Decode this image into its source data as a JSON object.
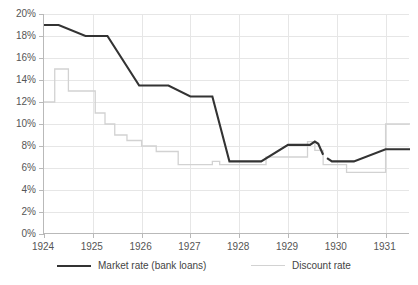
{
  "chart_data": {
    "type": "line",
    "title": "",
    "subtitle": "",
    "xlabel": "",
    "ylabel": "",
    "xlim": [
      1924.0,
      1931.5
    ],
    "ylim": [
      0,
      20
    ],
    "grid": true,
    "legend_position": "bottom",
    "y_ticks": [
      "0%",
      "2%",
      "4%",
      "6%",
      "8%",
      "10%",
      "12%",
      "14%",
      "16%",
      "18%",
      "20%"
    ],
    "y_tick_values": [
      0,
      2,
      4,
      6,
      8,
      10,
      12,
      14,
      16,
      18,
      20
    ],
    "x_ticks": [
      "1924",
      "1925",
      "1926",
      "1927",
      "1928",
      "1929",
      "1930",
      "1931"
    ],
    "x_tick_values": [
      1924,
      1925,
      1926,
      1927,
      1928,
      1929,
      1930,
      1931
    ],
    "colors": {
      "market_rate": "#333333",
      "discount_rate": "#d2d2d2",
      "grid": "#e6e6e6",
      "axis": "#b9b9b9",
      "text": "#555555",
      "background": "#ffffff"
    },
    "series": [
      {
        "name": "Market rate (bank loans)",
        "style": "solid-thick",
        "color": "#333333",
        "points": [
          [
            1924.0,
            19.0
          ],
          [
            1924.3,
            19.0
          ],
          [
            1924.85,
            18.0
          ],
          [
            1925.3,
            18.0
          ],
          [
            1925.95,
            13.5
          ],
          [
            1926.55,
            13.5
          ],
          [
            1927.0,
            12.5
          ],
          [
            1927.45,
            12.5
          ],
          [
            1927.8,
            6.6
          ],
          [
            1928.45,
            6.6
          ],
          [
            1929.0,
            8.1
          ],
          [
            1929.45,
            8.1
          ],
          [
            1929.55,
            8.4
          ],
          [
            1929.62,
            8.2
          ],
          [
            1929.72,
            7.2
          ]
        ],
        "points_segment2": [
          [
            1929.8,
            6.9
          ],
          [
            1929.9,
            6.6
          ],
          [
            1930.35,
            6.6
          ],
          [
            1931.0,
            7.7
          ],
          [
            1931.5,
            7.7
          ]
        ]
      },
      {
        "name": "Discount rate",
        "style": "step",
        "color": "#d2d2d2",
        "step_points": [
          [
            1924.0,
            12.0
          ],
          [
            1924.22,
            12.0
          ],
          [
            1924.22,
            15.0
          ],
          [
            1924.5,
            15.0
          ],
          [
            1924.5,
            13.0
          ],
          [
            1925.05,
            13.0
          ],
          [
            1925.05,
            11.0
          ],
          [
            1925.25,
            11.0
          ],
          [
            1925.25,
            10.0
          ],
          [
            1925.45,
            10.0
          ],
          [
            1925.45,
            9.0
          ],
          [
            1925.7,
            9.0
          ],
          [
            1925.7,
            8.5
          ],
          [
            1926.0,
            8.5
          ],
          [
            1926.0,
            8.0
          ],
          [
            1926.3,
            8.0
          ],
          [
            1926.3,
            7.5
          ],
          [
            1926.75,
            7.5
          ],
          [
            1926.75,
            6.3
          ],
          [
            1927.45,
            6.3
          ],
          [
            1927.45,
            6.6
          ],
          [
            1927.6,
            6.6
          ],
          [
            1927.6,
            6.3
          ],
          [
            1928.55,
            6.3
          ],
          [
            1928.55,
            7.0
          ],
          [
            1929.4,
            7.0
          ],
          [
            1929.4,
            8.4
          ],
          [
            1929.55,
            8.4
          ],
          [
            1929.55,
            7.6
          ],
          [
            1929.72,
            7.6
          ],
          [
            1929.72,
            6.3
          ],
          [
            1930.2,
            6.3
          ],
          [
            1930.2,
            5.6
          ],
          [
            1931.0,
            5.6
          ],
          [
            1931.0,
            10.0
          ],
          [
            1931.5,
            10.0
          ]
        ]
      }
    ],
    "legend": [
      {
        "label": "Market rate (bank loans)",
        "swatch": "solid-thick-dark"
      },
      {
        "label": "Discount rate",
        "swatch": "solid-thin-gray"
      }
    ]
  }
}
